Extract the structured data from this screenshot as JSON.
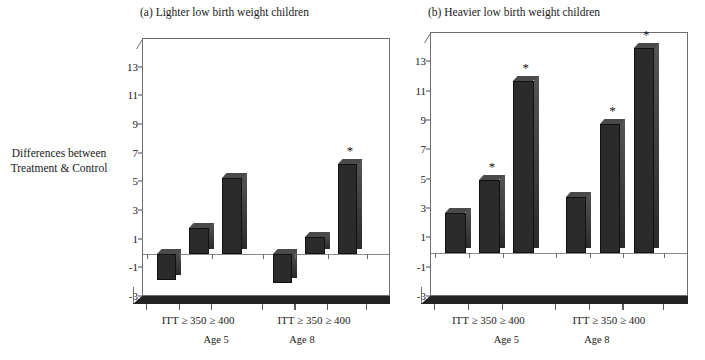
{
  "axis_label": {
    "line1": "Differences between",
    "line2": "Treatment & Control"
  },
  "panels": [
    {
      "title": "(a) Lighter low birth weight children",
      "groups": [
        {
          "age": "Age 5",
          "tick_label": "ITT ≥ 350 ≥ 400"
        },
        {
          "age": "Age 8",
          "tick_label": "ITT ≥ 350 ≥ 400"
        }
      ]
    },
    {
      "title": "(b) Heavier low birth weight children",
      "groups": [
        {
          "age": "Age 5",
          "tick_label": "ITT ≥ 350 ≥ 400"
        },
        {
          "age": "Age 8",
          "tick_label": "ITT ≥ 350 ≥ 400"
        }
      ]
    }
  ],
  "significance_marker": "*",
  "yticks": [
    "13",
    "11",
    "9",
    "7",
    "5",
    "3",
    "1",
    "-1",
    "-3"
  ],
  "chart_data": {
    "type": "bar",
    "xlabel": "",
    "ylabel": "Differences between Treatment & Control",
    "ylim": [
      -3,
      15
    ],
    "ytick_values": [
      13,
      11,
      9,
      7,
      5,
      3,
      1,
      -1,
      -3
    ],
    "grid": false,
    "legend": null,
    "annotation_note": "* denotes statistically significant difference",
    "panels": [
      {
        "panel": "a",
        "title": "(a) Lighter low birth weight children",
        "categories": [
          "ITT",
          "≥ 350",
          "≥ 400",
          "ITT",
          "≥ 350",
          "≥ 400"
        ],
        "group_labels": [
          "Age 5",
          "Age 8"
        ],
        "values": [
          -1.8,
          1.8,
          5.3,
          -2.0,
          1.2,
          6.3
        ],
        "significant": [
          false,
          false,
          false,
          false,
          false,
          true
        ]
      },
      {
        "panel": "b",
        "title": "(b) Heavier low birth weight children",
        "categories": [
          "ITT",
          "≥ 350",
          "≥ 400",
          "ITT",
          "≥ 350",
          "≥ 400"
        ],
        "group_labels": [
          "Age 5",
          "Age 8"
        ],
        "values": [
          2.7,
          5.0,
          11.7,
          3.8,
          8.8,
          14.0
        ],
        "significant": [
          false,
          true,
          true,
          false,
          true,
          true
        ]
      }
    ]
  },
  "colors": {
    "bar": "#2b2b2b",
    "bar_top": "#4a4a4a",
    "axis": "#6e6e6e",
    "floor": "#232323",
    "background": "#ffffff"
  }
}
